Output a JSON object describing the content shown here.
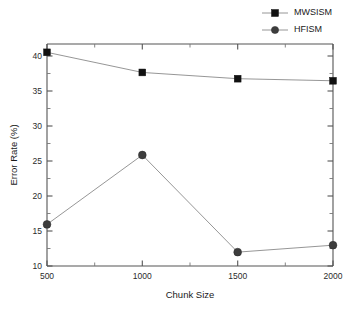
{
  "chart_data": {
    "type": "line",
    "title": "",
    "xlabel": "Chunk Size",
    "ylabel": "Error Rate (%)",
    "x": [
      500,
      1000,
      1500,
      2000
    ],
    "xtick_labels": [
      "500",
      "1000",
      "1500",
      "2000"
    ],
    "ytick_labels": [
      "10",
      "15",
      "20",
      "25",
      "30",
      "35",
      "40"
    ],
    "yticks": [
      10,
      15,
      20,
      25,
      30,
      35,
      40
    ],
    "xlim": [
      500,
      2000
    ],
    "ylim": [
      10,
      42
    ],
    "grid": false,
    "legend_position": "top-right-outside",
    "series": [
      {
        "name": "MWSISM",
        "marker": "square",
        "color": "#111111",
        "values": [
          40.8,
          37.9,
          37.0,
          36.7
        ]
      },
      {
        "name": "HFISM",
        "marker": "circle",
        "color": "#3d3d3d",
        "values": [
          16.0,
          26.0,
          12.0,
          13.0
        ]
      }
    ]
  },
  "legend": {
    "entries": [
      {
        "label": "MWSISM"
      },
      {
        "label": "HFISM"
      }
    ]
  }
}
